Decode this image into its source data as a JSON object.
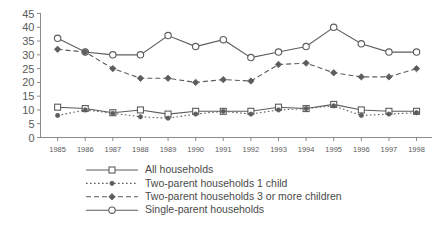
{
  "chart_data": {
    "type": "line",
    "title": "",
    "subtitle": "",
    "xlabel": "",
    "ylabel": "",
    "grid": false,
    "legend_position": "bottom",
    "x": [
      1985,
      1986,
      1987,
      1988,
      1989,
      1990,
      1991,
      1992,
      1993,
      1994,
      1995,
      1996,
      1997,
      1998
    ],
    "xtick_labels": [
      "1985",
      "1986",
      "1987",
      "1988",
      "1989",
      "1990",
      "1991",
      "1992",
      "1993",
      "1994",
      "1995",
      "1996",
      "1997",
      "1998"
    ],
    "ytick_labels": [
      "0",
      "5",
      "10",
      "15",
      "20",
      "25",
      "30",
      "35",
      "40",
      "45"
    ],
    "yticks": [
      0,
      5,
      10,
      15,
      20,
      25,
      30,
      35,
      40,
      45
    ],
    "ylim": [
      0,
      45
    ],
    "xlim": [
      1985,
      1998
    ],
    "series": [
      {
        "name": "All households",
        "marker": "open-square",
        "linestyle": "solid",
        "color": "#5d5d5d",
        "values": [
          11,
          10.5,
          9,
          10,
          8.5,
          9.5,
          9.5,
          9.5,
          11,
          10.5,
          12,
          10,
          9.5,
          9.5
        ]
      },
      {
        "name": "Two-parent households 1 child",
        "marker": "filled-circle",
        "linestyle": "dotted",
        "color": "#5d5d5d",
        "values": [
          8,
          10,
          8.8,
          7.5,
          7,
          8.5,
          9.5,
          8.5,
          10,
          10.5,
          11.5,
          8,
          8.5,
          9
        ]
      },
      {
        "name": "Two-parent households 3 or more children",
        "marker": "filled-diamond",
        "linestyle": "dashed",
        "color": "#5d5d5d",
        "values": [
          32,
          31,
          25,
          21.5,
          21.5,
          20,
          21,
          20.5,
          26.5,
          27,
          23.5,
          22,
          22,
          25
        ]
      },
      {
        "name": "Single-parent households",
        "marker": "open-circle",
        "linestyle": "solid",
        "color": "#5d5d5d",
        "values": [
          36,
          31,
          30,
          30,
          37,
          33,
          35.5,
          29,
          31,
          33,
          40,
          34,
          31,
          31
        ]
      }
    ]
  },
  "legend": {
    "entries": [
      {
        "label": "All households"
      },
      {
        "label": "Two-parent households 1 child"
      },
      {
        "label": "Two-parent households 3 or more children"
      },
      {
        "label": "Single-parent households"
      }
    ]
  },
  "colors": {
    "ink": "#5d5d5d",
    "axis": "#8a8a8a",
    "text": "#4a4a4a",
    "background": "#ffffff"
  }
}
